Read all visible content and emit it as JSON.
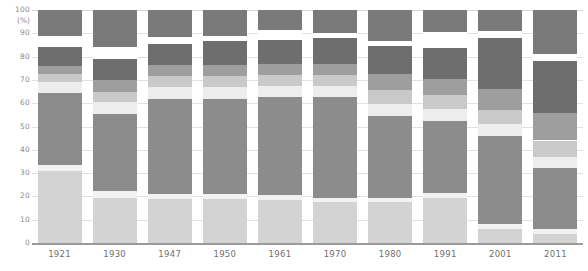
{
  "chart_data": {
    "type": "bar",
    "stacked": true,
    "title": "",
    "subtitle": "",
    "xlabel": "",
    "ylabel": "(%)",
    "ylim": [
      0,
      100
    ],
    "ytick_labels": [
      "0",
      "10",
      "20",
      "30",
      "40",
      "50",
      "60",
      "70",
      "80",
      "90",
      "100"
    ],
    "ytick_values": [
      0,
      10,
      20,
      30,
      40,
      50,
      60,
      70,
      80,
      90,
      100
    ],
    "grid": true,
    "legend": "none",
    "categories": [
      "1921",
      "1930",
      "1947",
      "1950",
      "1961",
      "1970",
      "1980",
      "1991",
      "2001",
      "2011"
    ],
    "series": [
      {
        "name": "series-1",
        "color": "#d3d3d3",
        "values": [
          31.0,
          19.5,
          19.0,
          19.0,
          18.5,
          17.5,
          17.5,
          19.5,
          6.0,
          4.0
        ]
      },
      {
        "name": "series-2",
        "color": "#f2f2f2",
        "values": [
          2.5,
          3.0,
          2.0,
          2.0,
          2.0,
          2.0,
          2.0,
          2.0,
          2.0,
          2.0
        ]
      },
      {
        "name": "series-3",
        "color": "#8c8c8c",
        "values": [
          31.0,
          33.0,
          41.0,
          41.0,
          42.0,
          43.0,
          35.0,
          31.0,
          38.0,
          26.0
        ]
      },
      {
        "name": "series-4",
        "color": "#ededed",
        "values": [
          4.5,
          5.0,
          5.0,
          5.0,
          5.0,
          5.0,
          5.0,
          5.0,
          5.0,
          5.0
        ]
      },
      {
        "name": "series-5",
        "color": "#c9c9c9",
        "values": [
          3.5,
          4.5,
          4.5,
          4.5,
          4.5,
          4.5,
          6.0,
          6.0,
          6.0,
          7.0
        ]
      },
      {
        "name": "series-6",
        "color": "#9e9e9e",
        "values": [
          3.5,
          5.0,
          5.0,
          5.0,
          5.0,
          5.0,
          7.0,
          7.0,
          9.0,
          12.0
        ]
      },
      {
        "name": "series-7",
        "color": "#6e6e6e",
        "values": [
          8.0,
          9.0,
          9.0,
          10.0,
          10.0,
          11.0,
          12.0,
          13.0,
          22.0,
          22.0
        ]
      },
      {
        "name": "series-gap",
        "color": "#ffffff",
        "values": [
          5.0,
          5.0,
          3.0,
          2.5,
          4.5,
          2.0,
          2.0,
          7.0,
          3.0,
          3.0
        ]
      },
      {
        "name": "series-8",
        "color": "#7a7a7a",
        "values": [
          11.0,
          16.0,
          11.5,
          11.0,
          8.5,
          10.0,
          13.5,
          9.5,
          9.0,
          19.0
        ]
      }
    ],
    "bar_tops": [
      100,
      100,
      100,
      100,
      100,
      100,
      100,
      100,
      100,
      100
    ]
  },
  "axis": {
    "y_unit_label": "(%)"
  }
}
